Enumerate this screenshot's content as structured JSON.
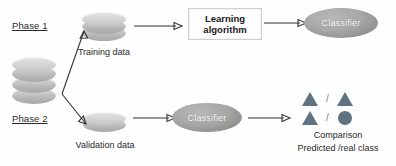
{
  "diagram": {
    "phases": [
      {
        "label": "Phase 1"
      },
      {
        "label": "Phase 2"
      }
    ],
    "nodes": {
      "source_database": {
        "name": "source-database",
        "label": ""
      },
      "training_data": {
        "label": "Training data"
      },
      "validation_data": {
        "label": "Validation data"
      },
      "learning_algorithm": {
        "line1": "Learning",
        "line2": "algorithm"
      },
      "classifier_top": {
        "label": "Classifier"
      },
      "classifier_bottom": {
        "label": "Classifier"
      }
    },
    "outcome": {
      "rows": [
        {
          "left": "triangle",
          "separator": "/",
          "right": "triangle"
        },
        {
          "left": "triangle",
          "separator": "/",
          "right": "circle"
        }
      ],
      "caption_line1": "Comparison",
      "caption_line2": "Predicted /real class"
    },
    "colors": {
      "shape": "#5f7282",
      "ellipse": "#a7a7a7",
      "cylinder": "#c9c9c9",
      "arrow": "#333333",
      "text": "#2a2a2a",
      "background": "#fefefe"
    }
  }
}
